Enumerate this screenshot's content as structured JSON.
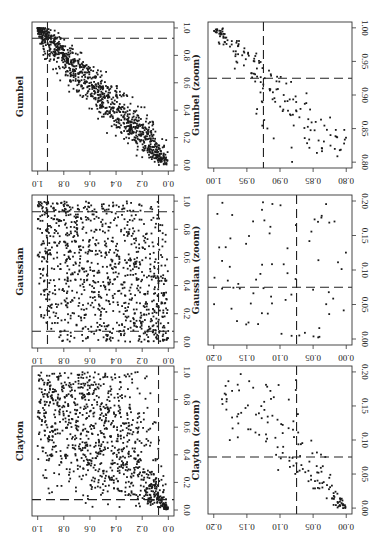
{
  "chart_data": [
    {
      "type": "scatter",
      "title": "Gumbel",
      "xlabel": "",
      "ylabel": "",
      "xlim": [
        0,
        1
      ],
      "ylim": [
        0,
        1
      ],
      "x_ticks": [
        "0.0",
        "0.2",
        "0.4",
        "0.6",
        "0.8",
        "1.0"
      ],
      "y_ticks": [
        "0.0",
        "0.2",
        "0.4",
        "0.6",
        "0.8",
        "1.0"
      ],
      "dashed_lines": {
        "x": 0.925,
        "y": 0.925
      },
      "n_points": 1000,
      "pattern": "strong positive upper-tail dependence along diagonal",
      "panel": "top-left"
    },
    {
      "type": "scatter",
      "title": "Gumbel (zoom)",
      "xlim": [
        0.8,
        1.0
      ],
      "ylim": [
        0.8,
        1.0
      ],
      "x_ticks": [
        "0.80",
        "0.85",
        "0.90",
        "0.95",
        "1.00"
      ],
      "y_ticks": [
        "0.80",
        "0.85",
        "0.90",
        "0.95",
        "1.00"
      ],
      "dashed_lines": {
        "x": 0.925,
        "y": 0.925
      },
      "pattern": "points clustered near (1,1), spreading toward (0.8,0.8)",
      "panel": "top-right"
    },
    {
      "type": "scatter",
      "title": "Gaussian",
      "xlim": [
        0,
        1
      ],
      "ylim": [
        0,
        1
      ],
      "x_ticks": [
        "0.0",
        "0.2",
        "0.4",
        "0.6",
        "0.8",
        "1.0"
      ],
      "y_ticks": [
        "0.0",
        "0.2",
        "0.4",
        "0.6",
        "0.8",
        "1.0"
      ],
      "dashed_lines": {
        "x": [
          0.075,
          0.925
        ],
        "y": [
          0.075,
          0.925
        ]
      },
      "n_points": 1000,
      "pattern": "weak/near-independent scatter",
      "panel": "middle-left"
    },
    {
      "type": "scatter",
      "title": "Gaussian (zoom)",
      "xlim": [
        0,
        0.2
      ],
      "ylim": [
        0,
        0.2
      ],
      "x_ticks": [
        "0.00",
        "0.05",
        "0.10",
        "0.15",
        "0.20"
      ],
      "y_ticks": [
        "0.00",
        "0.05",
        "0.10",
        "0.15",
        "0.20"
      ],
      "dashed_lines": {
        "x": 0.075,
        "y": 0.075
      },
      "pattern": "sparse scattered points, no tail concentration",
      "panel": "middle-right"
    },
    {
      "type": "scatter",
      "title": "Clayton",
      "xlim": [
        0,
        1
      ],
      "ylim": [
        0,
        1
      ],
      "x_ticks": [
        "0.0",
        "0.2",
        "0.4",
        "0.6",
        "0.8",
        "1.0"
      ],
      "y_ticks": [
        "0.0",
        "0.2",
        "0.4",
        "0.6",
        "0.8",
        "1.0"
      ],
      "dashed_lines": {
        "x": 0.075,
        "y": 0.075
      },
      "n_points": 1000,
      "pattern": "lower-tail dependence, dense cluster near (0,0)",
      "panel": "bottom-left"
    },
    {
      "type": "scatter",
      "title": "Clayton (zoom)",
      "xlim": [
        0,
        0.2
      ],
      "ylim": [
        0,
        0.2
      ],
      "x_ticks": [
        "0.00",
        "0.05",
        "0.10",
        "0.15",
        "0.20"
      ],
      "y_ticks": [
        "0.00",
        "0.05",
        "0.10",
        "0.15",
        "0.20"
      ],
      "dashed_lines": {
        "x": 0.075,
        "y": 0.075
      },
      "pattern": "points concentrated toward (0,0) along diagonal",
      "panel": "bottom-right"
    }
  ],
  "figure": {
    "orientation": "rotated 90 degrees clockwise",
    "panels": [
      {
        "title": "Gumbel",
        "box": [
          32,
          22,
          174,
          171
        ],
        "kind": "gumbel",
        "ticks": [
          "0.0",
          "0.2",
          "0.4",
          "0.6",
          "0.8",
          "1.0"
        ],
        "lo": 0,
        "hi": 1,
        "dash": [
          0.925
        ],
        "seed": 11
      },
      {
        "title": "Gumbel (zoom)",
        "box": [
          208,
          22,
          352,
          168
        ],
        "kind": "gumbelzoom",
        "ticks": [
          "0.80",
          "0.85",
          "0.90",
          "0.95",
          "1.00"
        ],
        "lo": 0.8,
        "hi": 1.0,
        "dash": [
          0.925
        ],
        "seed": 23
      },
      {
        "title": "Gaussian",
        "box": [
          32,
          195,
          174,
          348
        ],
        "kind": "gauss",
        "ticks": [
          "0.0",
          "0.2",
          "0.4",
          "0.6",
          "0.8",
          "1.0"
        ],
        "lo": 0,
        "hi": 1,
        "dash": [
          0.075,
          0.925
        ],
        "seed": 37
      },
      {
        "title": "Gaussian (zoom)",
        "box": [
          208,
          195,
          352,
          345
        ],
        "kind": "gausszoom",
        "ticks": [
          "0.00",
          "0.05",
          "0.10",
          "0.15",
          "0.20"
        ],
        "lo": 0,
        "hi": 0.2,
        "dash": [
          0.075
        ],
        "seed": 41
      },
      {
        "title": "Clayton",
        "box": [
          32,
          366,
          174,
          516
        ],
        "kind": "clayton",
        "ticks": [
          "0.0",
          "0.2",
          "0.4",
          "0.6",
          "0.8",
          "1.0"
        ],
        "lo": 0,
        "hi": 1,
        "dash": [
          0.075
        ],
        "seed": 53
      },
      {
        "title": "Clayton (zoom)",
        "box": [
          208,
          366,
          352,
          514
        ],
        "kind": "claytonzoom",
        "ticks": [
          "0.00",
          "0.05",
          "0.10",
          "0.15",
          "0.20"
        ],
        "lo": 0,
        "hi": 0.2,
        "dash": [
          0.075
        ],
        "seed": 67
      }
    ]
  }
}
